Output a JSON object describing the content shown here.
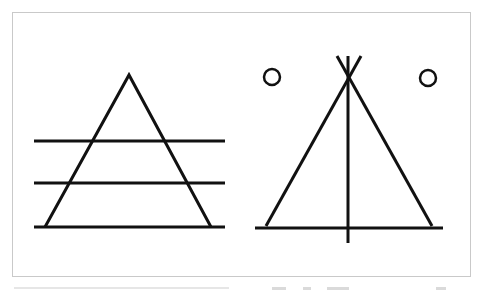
{
  "diagram": {
    "type": "line-drawing",
    "frame": {
      "x": 12,
      "y": 12,
      "width": 459,
      "height": 265,
      "border_color": "#c9c9c9"
    },
    "stroke_color": "#111111",
    "stroke_width": 3,
    "figures": [
      {
        "name": "triangle-with-horizontal-lines",
        "triangle": {
          "apex": [
            129,
            75
          ],
          "base_left": [
            45,
            227
          ],
          "base_right": [
            211,
            227
          ]
        },
        "horizontal_lines": [
          {
            "y": 141,
            "x1": 34,
            "x2": 225
          },
          {
            "y": 183,
            "x1": 34,
            "x2": 225
          },
          {
            "y": 227,
            "x1": 34,
            "x2": 225
          }
        ]
      },
      {
        "name": "tipi-with-circles",
        "poles": [
          {
            "from": [
              266,
              226
            ],
            "to": [
              361,
              56
            ]
          },
          {
            "from": [
              432,
              226
            ],
            "to": [
              337,
              56
            ]
          }
        ],
        "vertical_line": {
          "x": 348,
          "y1": 56,
          "y2": 243
        },
        "base_line": {
          "y": 228,
          "x1": 255,
          "x2": 443
        },
        "circles": [
          {
            "cx": 272,
            "cy": 77,
            "r": 8
          },
          {
            "cx": 428,
            "cy": 78,
            "r": 8
          }
        ]
      }
    ]
  },
  "caption": {
    "left_visible": "",
    "right_visible": ""
  }
}
